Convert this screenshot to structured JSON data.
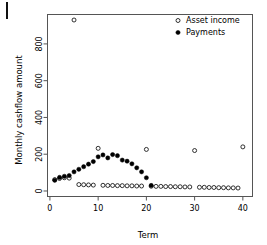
{
  "figure": {
    "width": 267,
    "height": 245,
    "background": "#ffffff",
    "frame_color": "#555555",
    "point_color": "#000000"
  },
  "chart_data": {
    "type": "scatter",
    "title": "",
    "subtitle": "",
    "xlabel": "Term",
    "ylabel": "Monthly cashflow amount",
    "xlim": [
      -0.5,
      42
    ],
    "ylim": [
      -30,
      960
    ],
    "xticks": [
      0,
      10,
      20,
      30,
      40
    ],
    "xtick_labels": [
      "0",
      "10",
      "20",
      "30",
      "40"
    ],
    "yticks": [
      0,
      200,
      400,
      600,
      800
    ],
    "ytick_labels": [
      "0",
      "200",
      "400",
      "600",
      "800"
    ],
    "grid": false,
    "legend_position": "top-right",
    "legend": [
      {
        "name": "Asset income",
        "marker": "open-circle"
      },
      {
        "name": "Payments",
        "marker": "filled-circle"
      }
    ],
    "series": [
      {
        "name": "Asset income",
        "marker": "open-circle",
        "points": [
          {
            "x": 1,
            "y": 62
          },
          {
            "x": 2,
            "y": 68
          },
          {
            "x": 3,
            "y": 72
          },
          {
            "x": 4,
            "y": 70
          },
          {
            "x": 5,
            "y": 930
          },
          {
            "x": 6,
            "y": 35
          },
          {
            "x": 7,
            "y": 34
          },
          {
            "x": 8,
            "y": 33
          },
          {
            "x": 9,
            "y": 32
          },
          {
            "x": 10,
            "y": 232
          },
          {
            "x": 11,
            "y": 31
          },
          {
            "x": 12,
            "y": 30
          },
          {
            "x": 13,
            "y": 30
          },
          {
            "x": 14,
            "y": 29
          },
          {
            "x": 15,
            "y": 29
          },
          {
            "x": 16,
            "y": 28
          },
          {
            "x": 17,
            "y": 28
          },
          {
            "x": 18,
            "y": 27
          },
          {
            "x": 19,
            "y": 27
          },
          {
            "x": 20,
            "y": 226
          },
          {
            "x": 21,
            "y": 26
          },
          {
            "x": 22,
            "y": 25
          },
          {
            "x": 23,
            "y": 25
          },
          {
            "x": 24,
            "y": 24
          },
          {
            "x": 25,
            "y": 24
          },
          {
            "x": 26,
            "y": 23
          },
          {
            "x": 27,
            "y": 23
          },
          {
            "x": 28,
            "y": 22
          },
          {
            "x": 29,
            "y": 22
          },
          {
            "x": 30,
            "y": 220
          },
          {
            "x": 31,
            "y": 20
          },
          {
            "x": 32,
            "y": 20
          },
          {
            "x": 33,
            "y": 19
          },
          {
            "x": 34,
            "y": 19
          },
          {
            "x": 35,
            "y": 18
          },
          {
            "x": 36,
            "y": 18
          },
          {
            "x": 37,
            "y": 17
          },
          {
            "x": 38,
            "y": 17
          },
          {
            "x": 39,
            "y": 16
          },
          {
            "x": 40,
            "y": 240
          }
        ]
      },
      {
        "name": "Payments",
        "marker": "filled-circle",
        "points": [
          {
            "x": 1,
            "y": 58
          },
          {
            "x": 2,
            "y": 74
          },
          {
            "x": 3,
            "y": 80
          },
          {
            "x": 4,
            "y": 84
          },
          {
            "x": 5,
            "y": 104
          },
          {
            "x": 6,
            "y": 118
          },
          {
            "x": 7,
            "y": 132
          },
          {
            "x": 8,
            "y": 146
          },
          {
            "x": 9,
            "y": 160
          },
          {
            "x": 10,
            "y": 186
          },
          {
            "x": 11,
            "y": 196
          },
          {
            "x": 12,
            "y": 180
          },
          {
            "x": 13,
            "y": 198
          },
          {
            "x": 14,
            "y": 192
          },
          {
            "x": 15,
            "y": 168
          },
          {
            "x": 16,
            "y": 162
          },
          {
            "x": 17,
            "y": 148
          },
          {
            "x": 18,
            "y": 126
          },
          {
            "x": 19,
            "y": 104
          },
          {
            "x": 20,
            "y": 72
          },
          {
            "x": 21,
            "y": 30
          }
        ]
      }
    ]
  }
}
